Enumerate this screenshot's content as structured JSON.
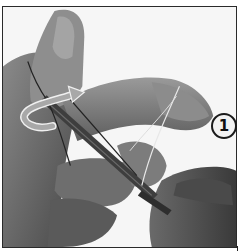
{
  "figure": {
    "step_number": "1",
    "colors": {
      "background": "#ffffff",
      "border": "#2a2a2a",
      "skin_dark": "#5a5a5a",
      "skin_mid": "#7a7a7a",
      "skin_light": "#9a9a9a",
      "arrow_fill": "#a8a8a8",
      "arrow_stroke": "#f0f0f0",
      "badge_fill": "#f2f2f2",
      "badge_stroke": "#1a1a1a"
    }
  }
}
